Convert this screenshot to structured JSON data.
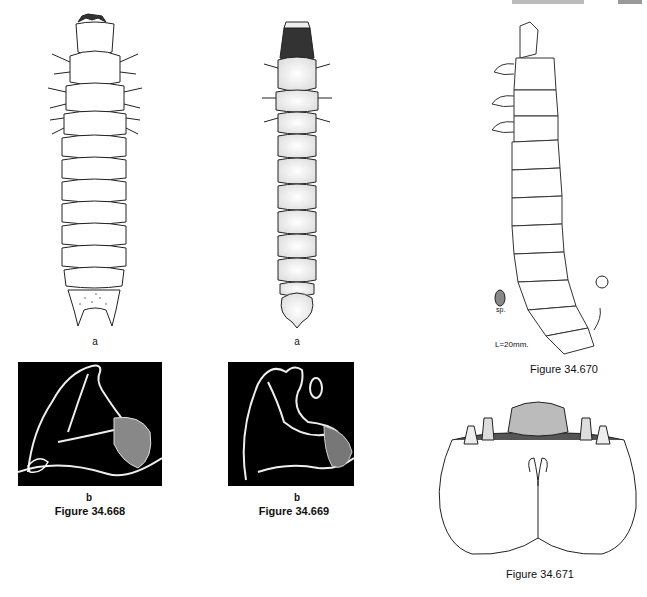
{
  "page": {
    "header_fragment": "",
    "figures": [
      {
        "id": "34.668",
        "caption": "Figure 34.668",
        "panels": [
          {
            "label": "a",
            "kind": "line drawing, larva dorsal view"
          },
          {
            "label": "b",
            "kind": "SEM micrograph, mandible"
          }
        ]
      },
      {
        "id": "34.669",
        "caption": "Figure 34.669",
        "panels": [
          {
            "label": "a",
            "kind": "stippled drawing, larva dorsal view"
          },
          {
            "label": "b",
            "kind": "SEM micrograph, mandible"
          }
        ]
      },
      {
        "id": "34.670",
        "caption": "Figure 34.670",
        "annotations": {
          "spiracle": "sp.",
          "scale": "L=20mm."
        }
      },
      {
        "id": "34.671",
        "caption": "Figure 34.671"
      }
    ],
    "labels": {
      "fig668_a": "a",
      "fig668_b": "b",
      "fig669_a": "a",
      "fig669_b": "b"
    }
  }
}
